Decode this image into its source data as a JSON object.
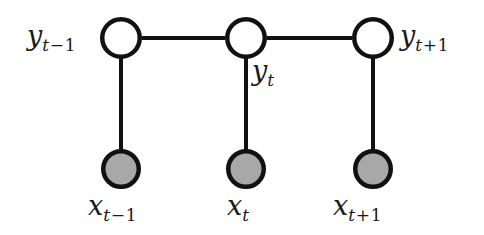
{
  "figure": {
    "background_color": "#ffffff",
    "width": 484,
    "height": 235
  },
  "style": {
    "edge_color": "#111111",
    "edge_width": 4,
    "node_stroke_color": "#111111",
    "node_stroke_width": 4.5,
    "hidden_node_fill": "#ffffff",
    "observed_node_fill": "#a8a8a8",
    "label_color": "#1a1a1a"
  },
  "nodes": {
    "hidden": [
      {
        "id": "y-prev",
        "cx": 121,
        "cy": 38,
        "r": 21,
        "shaded": false
      },
      {
        "id": "y-curr",
        "cx": 246,
        "cy": 38,
        "r": 21,
        "shaded": false
      },
      {
        "id": "y-next",
        "cx": 373,
        "cy": 38,
        "r": 21,
        "shaded": false
      }
    ],
    "observed": [
      {
        "id": "x-prev",
        "cx": 121,
        "cy": 169,
        "r": 20,
        "shaded": true
      },
      {
        "id": "x-curr",
        "cx": 246,
        "cy": 169,
        "r": 20,
        "shaded": true
      },
      {
        "id": "x-next",
        "cx": 373,
        "cy": 169,
        "r": 20,
        "shaded": true
      }
    ]
  },
  "edges": [
    {
      "id": "edge-y-prev-y-curr",
      "from": "y-prev",
      "to": "y-curr",
      "x1": 142,
      "y1": 38,
      "x2": 225,
      "y2": 38
    },
    {
      "id": "edge-y-curr-y-next",
      "from": "y-curr",
      "to": "y-next",
      "x1": 267,
      "y1": 38,
      "x2": 352,
      "y2": 38
    },
    {
      "id": "edge-y-prev-x-prev",
      "from": "y-prev",
      "to": "x-prev",
      "x1": 121,
      "y1": 59,
      "x2": 121,
      "y2": 149
    },
    {
      "id": "edge-y-curr-x-curr",
      "from": "y-curr",
      "to": "x-curr",
      "x1": 246,
      "y1": 59,
      "x2": 246,
      "y2": 149
    },
    {
      "id": "edge-y-next-x-next",
      "from": "y-next",
      "to": "x-next",
      "x1": 373,
      "y1": 59,
      "x2": 373,
      "y2": 149
    }
  ],
  "labels": {
    "y_prev": {
      "base": "y",
      "sub_op": "−",
      "sub_var": "t",
      "sub_num": "1",
      "text": "y t−1"
    },
    "y_curr": {
      "base": "y",
      "sub_op": "",
      "sub_var": "t",
      "sub_num": "",
      "text": "y t"
    },
    "y_next": {
      "base": "y",
      "sub_op": "+",
      "sub_var": "t",
      "sub_num": "1",
      "text": "y t+1"
    },
    "x_prev": {
      "base": "x",
      "sub_op": "−",
      "sub_var": "t",
      "sub_num": "1",
      "text": "x t−1"
    },
    "x_curr": {
      "base": "x",
      "sub_op": "",
      "sub_var": "t",
      "sub_num": "",
      "text": "x t"
    },
    "x_next": {
      "base": "x",
      "sub_op": "+",
      "sub_var": "t",
      "sub_num": "1",
      "text": "x t+1"
    }
  }
}
